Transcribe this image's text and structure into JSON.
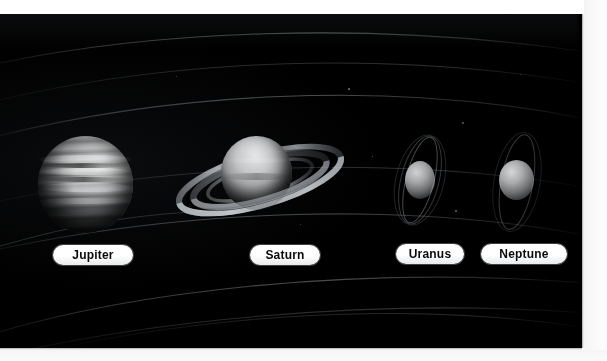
{
  "plate": {
    "title": "Gas giant planets of the outer solar system",
    "background_color": "#000000",
    "paper_color": "#ffffff",
    "medium": "scanned photographic plate",
    "label_pill_color": "#ffffff",
    "label_text_color": "#0a0a0a"
  },
  "planets": [
    {
      "id": "jupiter",
      "label": "Jupiter",
      "appearance": "large banded globe with horizontal cloud belts",
      "has_rings": false,
      "relative_size": "largest",
      "center": {
        "x": 85,
        "y": 170
      },
      "radius_px": 47
    },
    {
      "id": "saturn",
      "label": "Saturn",
      "appearance": "globe encircled by broad tilted ring system",
      "has_rings": true,
      "relative_size": "second largest",
      "center": {
        "x": 256,
        "y": 158
      },
      "radius_px": 35
    },
    {
      "id": "uranus",
      "label": "Uranus",
      "appearance": "small pale globe with steeply tilted narrow rings",
      "has_rings": true,
      "relative_size": "small",
      "center": {
        "x": 420,
        "y": 166
      },
      "radius_px": 15
    },
    {
      "id": "neptune",
      "label": "Neptune",
      "appearance": "small pale globe with faint partial ring arcs",
      "has_rings": true,
      "relative_size": "small",
      "center": {
        "x": 516,
        "y": 166
      },
      "radius_px": 17
    }
  ],
  "background_features": {
    "orbit_arcs": "faint concentric elliptical orbit lines sweeping left to right",
    "orbit_arc_count": 6,
    "starfield": "sparse faint specks"
  }
}
